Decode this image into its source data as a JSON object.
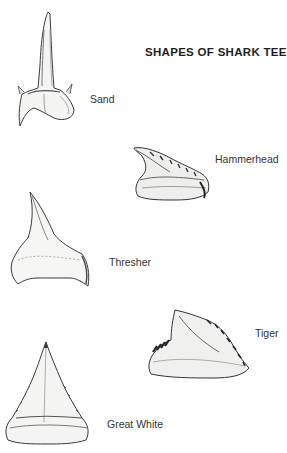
{
  "page": {
    "title": "SHAPES OF SHARK TEETH"
  },
  "teeth": [
    {
      "name": "Sand",
      "label": "Sand"
    },
    {
      "name": "Hammerhead",
      "label": "Hammerhead"
    },
    {
      "name": "Thresher",
      "label": "Thresher"
    },
    {
      "name": "Tiger",
      "label": "Tiger"
    },
    {
      "name": "Great White",
      "label": "Great White"
    }
  ],
  "colors": {
    "background": "#ffffff",
    "ink": "#2a2a2a",
    "shade": "#8a8a8a"
  }
}
